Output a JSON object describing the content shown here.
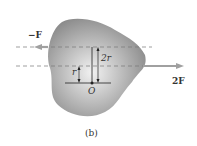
{
  "figure": {
    "caption": "(b)",
    "force_left_label": "−F",
    "force_right_label": "2F",
    "dist_2r_label": "2r",
    "dist_r_label": "r",
    "origin_label": "O"
  },
  "colors": {
    "body_fill_edge": "#8c8c8c",
    "body_fill_center": "#f0f0f0",
    "arrow": "#a0a0a0",
    "dashed": "#777777",
    "line": "#222222"
  }
}
